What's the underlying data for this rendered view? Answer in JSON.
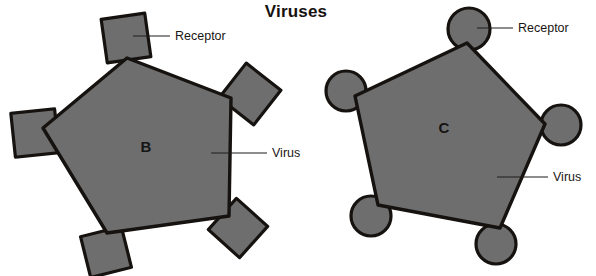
{
  "figure": {
    "title": "Viruses",
    "title_x": 296,
    "title_y": 17,
    "background_color": "#ffffff",
    "shape_fill": "#6e6e6e",
    "shape_stroke": "#15120f",
    "text_color": "#1a1613"
  },
  "panels": [
    {
      "id": "panel-b",
      "letter": "B",
      "letter_x": 146,
      "letter_y": 152,
      "receptor_shape": "square",
      "virus_body": {
        "name": "pentagon",
        "points": "127,58 231,98 229,216 107,233 43,128"
      },
      "receptors": [
        {
          "name": "receptor-top",
          "cx": 126,
          "cy": 38,
          "size": 44,
          "rotation": -8
        },
        {
          "name": "receptor-upper-right",
          "cx": 250,
          "cy": 94,
          "size": 44,
          "rotation": 38
        },
        {
          "name": "receptor-left",
          "cx": 35,
          "cy": 133,
          "size": 44,
          "rotation": -6
        },
        {
          "name": "receptor-lower-right",
          "cx": 238,
          "cy": 228,
          "size": 42,
          "rotation": 42
        },
        {
          "name": "receptor-bottom",
          "cx": 106,
          "cy": 252,
          "size": 42,
          "rotation": -14
        }
      ],
      "callouts": [
        {
          "name": "receptor-callout",
          "label": "Receptor",
          "line": "M 133,36 L 170,36",
          "text_x": 175,
          "text_y": 40
        },
        {
          "name": "virus-callout",
          "label": "Virus",
          "line": "M 211,153 L 267,153",
          "text_x": 272,
          "text_y": 157
        }
      ]
    },
    {
      "id": "panel-c",
      "letter": "C",
      "letter_x": 444,
      "letter_y": 133,
      "receptor_shape": "circle",
      "virus_body": {
        "name": "pentagon",
        "points": "467,43 545,124 500,228 378,205 355,96"
      },
      "receptors": [
        {
          "name": "receptor-top",
          "cx": 469,
          "cy": 29,
          "r": 21
        },
        {
          "name": "receptor-right",
          "cx": 561,
          "cy": 125,
          "r": 20
        },
        {
          "name": "receptor-left",
          "cx": 346,
          "cy": 91,
          "r": 20
        },
        {
          "name": "receptor-bottom-left",
          "cx": 371,
          "cy": 216,
          "r": 20
        },
        {
          "name": "receptor-bottom-right",
          "cx": 496,
          "cy": 244,
          "r": 20
        }
      ],
      "callouts": [
        {
          "name": "receptor-callout",
          "label": "Receptor",
          "line": "M 477,28 L 513,28",
          "text_x": 518,
          "text_y": 32
        },
        {
          "name": "virus-callout",
          "label": "Virus",
          "line": "M 497,177 L 548,177",
          "text_x": 553,
          "text_y": 181
        }
      ]
    }
  ]
}
